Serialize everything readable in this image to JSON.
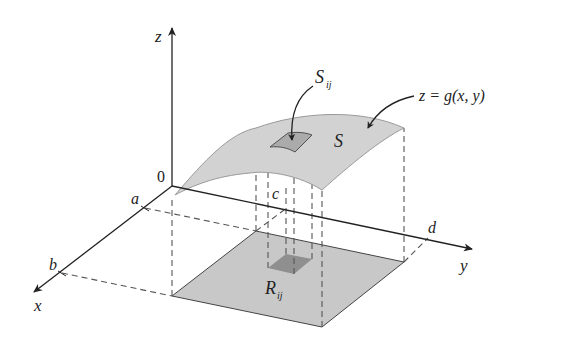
{
  "figure": {
    "axes": {
      "x_label": "x",
      "y_label": "y",
      "z_label": "z",
      "origin_label": "0"
    },
    "bounds": {
      "a": "a",
      "b": "b",
      "c": "c",
      "d": "d"
    },
    "surface": {
      "label": "S",
      "equation": "z = g(x, y)"
    },
    "patch": {
      "label_main": "S",
      "label_sub": "ij"
    },
    "region_patch": {
      "label_main": "R",
      "label_sub": "ij"
    },
    "colors": {
      "surface_fill": "#cfcfcf",
      "region_fill": "#c8c8c8",
      "patch_fill": "#a9a9a9",
      "region_patch_fill": "#8f8f8f",
      "line": "#222222"
    }
  }
}
